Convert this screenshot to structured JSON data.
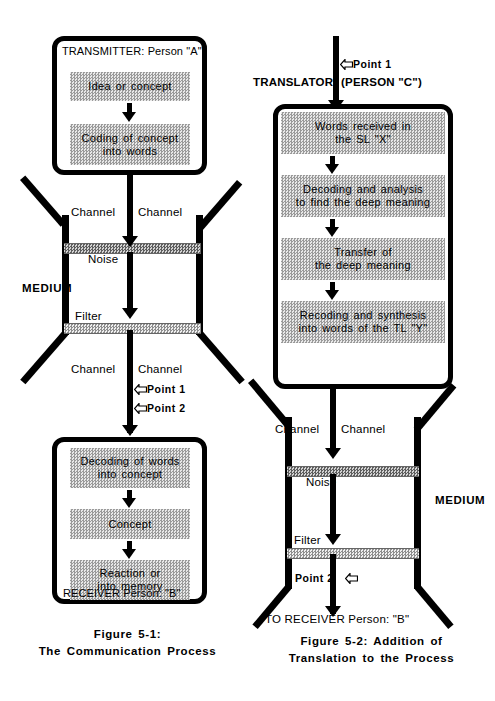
{
  "figure1": {
    "transmitter": {
      "title": "TRANSMITTER: Person \"A\"",
      "boxes": [
        {
          "lines": [
            "Idea or concept"
          ]
        },
        {
          "lines": [
            "Coding of concept",
            "into words"
          ]
        }
      ]
    },
    "medium": {
      "label": "MEDIUM",
      "channel_top_left": "Channel",
      "channel_top_right": "Channel",
      "channel_bottom_left": "Channel",
      "channel_bottom_right": "Channel",
      "noise_label": "Noise",
      "filter_label": "Filter",
      "points": [
        {
          "label": "Point 1",
          "arrow": "hollow-left-arrow-icon"
        },
        {
          "label": "Point 2",
          "arrow": "hollow-left-arrow-icon"
        }
      ]
    },
    "receiver": {
      "title": "RECEIVER Person: \"B\"",
      "boxes": [
        {
          "lines": [
            "Decoding of words",
            "into concept"
          ]
        },
        {
          "lines": [
            "Concept"
          ]
        },
        {
          "lines": [
            "Reaction or",
            "into memory"
          ]
        }
      ]
    },
    "caption_line1": "Figure 5-1:",
    "caption_line2": "The Communication Process"
  },
  "figure2": {
    "point_top": {
      "label": "Point 1",
      "arrow": "hollow-left-arrow-icon"
    },
    "translator": {
      "title_left": "TRANSLATOR",
      "title_right": "(PERSON \"C\")",
      "boxes": [
        {
          "lines": [
            "Words received in",
            "the SL \"X\""
          ]
        },
        {
          "lines": [
            "Decoding and analysis",
            "to find the deep meaning"
          ]
        },
        {
          "lines": [
            "Transfer of",
            "the deep meaning"
          ]
        },
        {
          "lines": [
            "Recoding and synthesis",
            "into words of the TL \"Y\""
          ]
        }
      ]
    },
    "medium": {
      "label": "MEDIUM",
      "channel_left": "Channel",
      "channel_right": "Channel",
      "noise_label": "Noise",
      "filter_label": "Filter",
      "point": {
        "label": "Point 2",
        "arrow": "hollow-left-arrow-icon"
      }
    },
    "to_receiver": "TO RECEIVER  Person: \"B\"",
    "caption_line1": "Figure 5-2: Addition of",
    "caption_line2": "Translation to the Process"
  },
  "colors": {
    "ink": "#000000",
    "background": "#ffffff",
    "halftone_border": "#b9b9b9",
    "noise_bar": "#5d5d5d",
    "filter_bar": "#8e8e8e"
  }
}
